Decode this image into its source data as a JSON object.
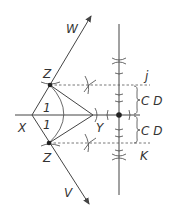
{
  "diagram": {
    "type": "geometric-construction",
    "labels": {
      "W": "W",
      "V": "V",
      "Z_top": "Z",
      "Z_bottom": "Z",
      "X": "X",
      "Y": "Y",
      "one_top": "1",
      "one_bottom": "1",
      "j": "j",
      "K": "K",
      "CD_top": "C D",
      "CD_bottom": "C D"
    },
    "colors": {
      "line": "#444444",
      "text": "#333333",
      "background": "#ffffff"
    }
  }
}
